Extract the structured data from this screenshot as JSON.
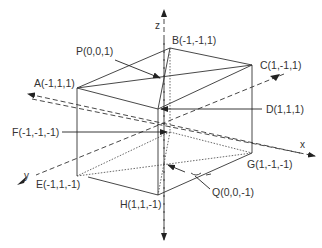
{
  "figure": {
    "type": "3D cube with coordinate axes",
    "colors": {
      "line": "#333333",
      "background": "#ffffff"
    }
  },
  "axes": {
    "x": {
      "label": "x"
    },
    "y": {
      "label": "y"
    },
    "z": {
      "label": "z"
    }
  },
  "vertices": {
    "A": {
      "label": "A(-1,1,1)"
    },
    "B": {
      "label": "B(-1,-1,1)"
    },
    "C": {
      "label": "C(1,-1,1)"
    },
    "D": {
      "label": "D(1,1,1)"
    },
    "E": {
      "label": "E(-1,1,-1)"
    },
    "F": {
      "label": "F(-1,-1,-1)"
    },
    "G": {
      "label": "G(1,-1,-1)"
    },
    "H": {
      "label": "H(1,1,-1)"
    }
  },
  "points": {
    "P": {
      "label": "P(0,0,1)"
    },
    "Q": {
      "label": "Q(0,0,-1)"
    }
  }
}
